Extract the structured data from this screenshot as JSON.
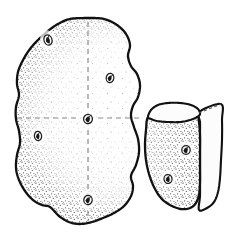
{
  "figure": {
    "title": "Potato tuber with quarter section",
    "background_color": "#ffffff",
    "ink_color": "#111111",
    "stipple_color": "#3a3a3a",
    "dash_color": "#8a8a8a",
    "cut_face_color": "#fcfcfc",
    "skin_fill_color": "#fdfdfd",
    "width": 230,
    "height": 233,
    "medium": "pen-and-ink stipple drawing",
    "objects": [
      {
        "id": "whole-tuber",
        "label": "Whole potato tuber",
        "outline_points": "88,18 104,19 117,25 126,34 130,45 128,56 131,66 137,74 140,85 138,97 133,106 131,116 134,127 138,139 139,152 136,165 131,176 133,186 131,196 124,206 114,213 103,218 92,222 80,224 69,222 59,216 50,207 42,205 33,200 25,191 19,180 16,168 17,155 20,143 19,131 16,119 16,107 19,95 17,84 18,72 23,60 30,49 38,40 48,31 58,24 70,19",
        "cut_lines": [
          {
            "id": "vertical-cut",
            "label": "vertical cutting plane",
            "x1": 88,
            "y1": 22,
            "x2": 88,
            "y2": 221
          },
          {
            "id": "horizontal-cut",
            "label": "horizontal cutting plane",
            "x1": 17,
            "y1": 118,
            "x2": 139,
            "y2": 118
          }
        ],
        "eyes": [
          {
            "id": "eye-top-left",
            "cx": 48,
            "cy": 40,
            "rx": 4.0,
            "ry": 5.2,
            "rot": -20
          },
          {
            "id": "eye-upper-right",
            "cx": 110,
            "cy": 78,
            "rx": 3.8,
            "ry": 4.6,
            "rot": 10
          },
          {
            "id": "eye-center",
            "cx": 88,
            "cy": 119,
            "rx": 4.4,
            "ry": 4.6,
            "rot": 0
          },
          {
            "id": "eye-left",
            "cx": 38,
            "cy": 136,
            "rx": 3.6,
            "ry": 4.6,
            "rot": -8
          },
          {
            "id": "eye-bottom",
            "cx": 88,
            "cy": 200,
            "rx": 4.2,
            "ry": 4.6,
            "rot": 5
          }
        ]
      },
      {
        "id": "quarter-wedge",
        "label": "Quarter section of potato",
        "skin_outline_points": "148,117 146,130 145,145 146,160 149,174 154,187 161,198 170,205 181,209 190,208 196,203 199,194 200,182 200,168 200,152 200,136 199,122 197,113 189,110 178,108 167,109 157,112",
        "top_face_points": "148,117 151,110 158,105 168,103 180,103 191,105 198,109 200,114 197,117 190,120 180,122 168,122 157,121 151,119",
        "right_face_points": "199,112 221,104 222,120 222,140 221,160 220,178 218,192 214,202 207,208 199,210 200,196 200,178 200,158 200,138 200,122",
        "apex_line": {
          "x1": 199,
          "y1": 113,
          "x2": 221,
          "y2": 104
        },
        "eyes": [
          {
            "id": "wedge-eye-upper",
            "cx": 186,
            "cy": 150,
            "rx": 4.2,
            "ry": 4.4,
            "rot": 0
          },
          {
            "id": "wedge-eye-lower",
            "cx": 168,
            "cy": 179,
            "rx": 4.0,
            "ry": 4.4,
            "rot": -12
          }
        ]
      }
    ]
  }
}
